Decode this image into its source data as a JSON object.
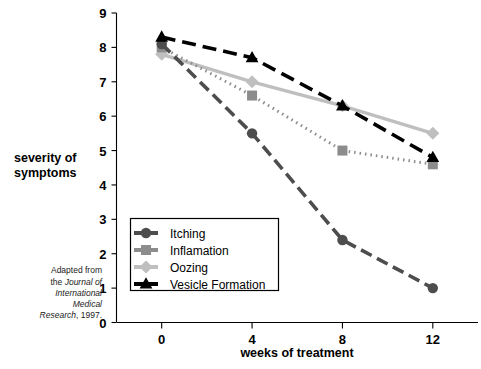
{
  "chart_data": {
    "type": "line",
    "title": "",
    "xlabel": "weeks of treatment",
    "ylabel": "severity of symptoms",
    "x": [
      0,
      4,
      8,
      12
    ],
    "xticklabels": [
      "0",
      "4",
      "8",
      "12"
    ],
    "yticklabels": [
      "0",
      "1",
      "2",
      "3",
      "4",
      "5",
      "6",
      "7",
      "8",
      "9"
    ],
    "xlim": [
      -2,
      14
    ],
    "ylim": [
      0,
      9
    ],
    "grid": false,
    "legend_position": "lower-left-inside",
    "series": [
      {
        "name": "Itching",
        "values": [
          8.1,
          5.5,
          2.4,
          1.0
        ],
        "color": "#4d4d4d",
        "marker": "circle",
        "dash": "12,6"
      },
      {
        "name": "Inflamation",
        "values": [
          8.0,
          6.6,
          5.0,
          4.6
        ],
        "color": "#8c8c8c",
        "marker": "square",
        "dash": "1.5,4"
      },
      {
        "name": "Oozing",
        "values": [
          7.8,
          7.0,
          6.3,
          5.5
        ],
        "color": "#bfbfbf",
        "marker": "diamond",
        "dash": "none"
      },
      {
        "name": "Vesicle Formation",
        "values": [
          8.3,
          7.7,
          6.3,
          4.8
        ],
        "color": "#000000",
        "marker": "triangle",
        "dash": "14,7"
      }
    ]
  },
  "yaxis": {
    "label_line1": "severity of",
    "label_line2": "symptoms"
  },
  "xaxis": {
    "label": "weeks of treatment"
  },
  "source_note": {
    "line1": "Adapted from",
    "line2_plain": "the ",
    "line2_italic": "Journal of",
    "line3_italic": "International",
    "line4_italic": "Medical",
    "line5_italic": "Research",
    "line5_plain": ", 1997."
  },
  "legend": {
    "items": [
      {
        "label": "Itching"
      },
      {
        "label": "Inflamation"
      },
      {
        "label": "Oozing"
      },
      {
        "label": "Vesicle Formation"
      }
    ]
  }
}
